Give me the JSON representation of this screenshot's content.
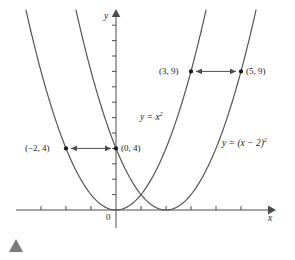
{
  "chart_data": {
    "type": "line",
    "title": "",
    "xlabel": "x",
    "ylabel": "y",
    "xlim": [
      -4,
      6.2
    ],
    "ylim": [
      -0.8,
      13
    ],
    "grid": false,
    "legend": "none",
    "series": [
      {
        "name": "y = x²",
        "equation": "y = x²",
        "vertex": [
          0,
          0
        ],
        "x": [
          -3.7,
          -3.5,
          -3,
          -2.5,
          -2,
          -1.5,
          -1,
          -0.5,
          0,
          0.5,
          1,
          1.5,
          2,
          2.5,
          3,
          3.4
        ],
        "values": [
          13.69,
          12.25,
          9,
          6.25,
          4,
          2.25,
          1,
          0.25,
          0,
          0.25,
          1,
          2.25,
          4,
          6.25,
          9,
          11.56
        ]
      },
      {
        "name": "y = (x − 2)²",
        "equation": "y = (x − 2)²",
        "vertex": [
          2,
          0
        ],
        "x": [
          -1.7,
          -1.5,
          -1,
          -0.5,
          0,
          0.5,
          1,
          1.5,
          2,
          2.5,
          3,
          3.5,
          4,
          4.5,
          5,
          5.4
        ],
        "values": [
          13.69,
          12.25,
          9,
          6.25,
          4,
          2.25,
          1,
          0.25,
          0,
          0.25,
          1,
          2.25,
          4,
          6.25,
          9,
          11.56
        ]
      }
    ],
    "points": [
      {
        "label": "(−2, 4)",
        "x": -2,
        "y": 4
      },
      {
        "label": "(0, 4)",
        "x": 0,
        "y": 4
      },
      {
        "label": "(3, 9)",
        "x": 3,
        "y": 9
      },
      {
        "label": "(5, 9)",
        "x": 5,
        "y": 9
      }
    ],
    "annotations": [
      {
        "name": "translation-arrow-lower",
        "from": [
          0,
          4
        ],
        "to": [
          -2,
          4
        ],
        "style": "double-headed"
      },
      {
        "name": "translation-arrow-upper",
        "from": [
          3,
          9
        ],
        "to": [
          5,
          9
        ],
        "style": "double-headed"
      }
    ],
    "xticks": [
      -3,
      -2,
      -1,
      0,
      1,
      2,
      3,
      4,
      5
    ],
    "yticks": [
      1,
      2,
      3,
      4,
      5,
      6,
      7,
      8,
      9,
      10,
      11,
      12
    ]
  },
  "axes": {
    "x_label": "x",
    "y_label": "y",
    "origin_label": "0"
  },
  "equations": {
    "parabola_1_prefix": "y = x",
    "parabola_1_exponent": "2",
    "parabola_2_prefix": "y = (x − 2)",
    "parabola_2_exponent": "2"
  },
  "point_labels": {
    "p_minus2_4": "(−2, 4)",
    "p_0_4": "(0, 4)",
    "p_3_9": "(3, 9)",
    "p_5_9": "(5, 9)"
  },
  "colors": {
    "curve": "#4d4d4d",
    "axis": "#4d4d4d",
    "text": "#1a1a1a",
    "marker": "#1a1a1a",
    "triangle": "#7a7a7a"
  },
  "footer": {
    "marker_name": "section-triangle-marker"
  }
}
